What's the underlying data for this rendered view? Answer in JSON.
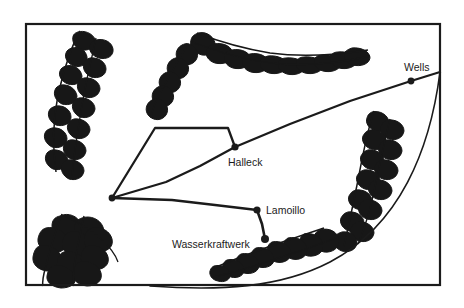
{
  "figure": {
    "kind": "hand-drawn-schematic-map",
    "title": "",
    "background_color": "#ffffff",
    "ink_color": "#1b1b1b",
    "frame": {
      "name": "map-border-frame",
      "x": 26,
      "y": 24,
      "width": 414,
      "height": 261,
      "stroke_width": 2.2,
      "closed_sides": [
        "top",
        "left",
        "bottom",
        "right"
      ]
    }
  },
  "labels": [
    {
      "id": "wells",
      "text": "Wells",
      "x": 404,
      "y": 71,
      "anchor": "start"
    },
    {
      "id": "halleck",
      "text": "Halleck",
      "x": 228,
      "y": 166,
      "anchor": "start"
    },
    {
      "id": "lamoillo",
      "text": "Lamoillo",
      "x": 266,
      "y": 214,
      "anchor": "start"
    },
    {
      "id": "wasserkraftwerk",
      "text": "Wasserkraftwerk",
      "x": 172,
      "y": 248,
      "anchor": "start"
    }
  ],
  "nodes": [
    {
      "id": "junction-west",
      "name": "junction-node-west",
      "x": 112,
      "y": 198,
      "r": 3.4,
      "label": ""
    },
    {
      "id": "halleck",
      "name": "substation-node-halleck",
      "x": 235,
      "y": 147,
      "r": 3.6,
      "label": "Halleck"
    },
    {
      "id": "wells",
      "name": "substation-node-wells",
      "x": 411,
      "y": 81,
      "r": 3.4,
      "label": "Wells"
    },
    {
      "id": "lamoillo",
      "name": "substation-node-lamoillo",
      "x": 257,
      "y": 210,
      "r": 3.6,
      "label": "Lamoillo"
    },
    {
      "id": "wasserkraftwerk",
      "name": "powerplant-node-wasserkraftwerk",
      "x": 265,
      "y": 239,
      "r": 4.0,
      "label": "Wasserkraftwerk"
    }
  ],
  "transmission_lines": [
    {
      "id": "line-west-polygon-north",
      "name": "transmission-line-west-north-loop",
      "points": "112,198 155,128 228,128 235,147",
      "stroke_width": 2.3
    },
    {
      "id": "line-west-halleck",
      "name": "transmission-line-west-halleck",
      "points": "112,198 166,182 200,166 235,147",
      "stroke_width": 2.3
    },
    {
      "id": "line-halleck-wells",
      "name": "transmission-line-halleck-wells",
      "points": "235,147 290,124 350,101 411,81 440,72",
      "stroke_width": 2.3
    },
    {
      "id": "line-west-lamoillo",
      "name": "transmission-line-west-lamoillo",
      "points": "112,198 172,200 215,205 257,210",
      "stroke_width": 2.3
    },
    {
      "id": "line-lamoillo-plant",
      "name": "transmission-line-lamoillo-wasserkraftwerk",
      "points": "257,210 262,224 265,239",
      "stroke_width": 2.6
    }
  ],
  "boundary_arc": {
    "id": "region-boundary-arc",
    "name": "region-boundary-arc",
    "path": "M 440,72 C 430,150 400,225 330,262 C 280,288 220,291 150,286",
    "stroke_width": 1.6
  },
  "mountain_ranges": [
    {
      "id": "ridge-northwest",
      "name": "mountain-range-northwest",
      "orientation": "north-south",
      "x": 40,
      "y": 30,
      "width": 70,
      "height": 150
    },
    {
      "id": "ridge-north",
      "name": "mountain-range-north",
      "orientation": "east-west",
      "x": 155,
      "y": 28,
      "width": 215,
      "height": 90
    },
    {
      "id": "ridge-east",
      "name": "mountain-range-east",
      "orientation": "north-south",
      "x": 340,
      "y": 110,
      "width": 70,
      "height": 135
    },
    {
      "id": "ridge-southwest",
      "name": "mountain-range-southwest",
      "orientation": "cluster",
      "x": 32,
      "y": 212,
      "width": 90,
      "height": 72
    },
    {
      "id": "ridge-south",
      "name": "mountain-range-south",
      "orientation": "east-west",
      "x": 212,
      "y": 228,
      "width": 130,
      "height": 58
    }
  ]
}
